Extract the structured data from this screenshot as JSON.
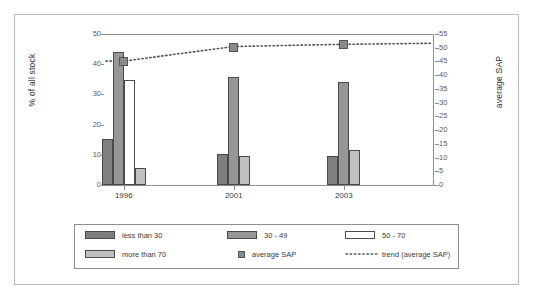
{
  "chart_data": {
    "type": "bar",
    "title": "",
    "subtitle": "",
    "categories": [
      "1996",
      "2001",
      "2003"
    ],
    "xlabel": "",
    "ylabel": "% of all stock",
    "ylabel_secondary": "average SAP",
    "ylim": [
      0,
      50
    ],
    "yticks": [
      0,
      10,
      20,
      30,
      40,
      50
    ],
    "ylim_secondary": [
      0,
      55
    ],
    "yticks_secondary": [
      0,
      5,
      10,
      15,
      20,
      25,
      30,
      35,
      40,
      45,
      50,
      55
    ],
    "grid": false,
    "legend_position": "bottom",
    "series": [
      {
        "name": "less than 30",
        "type": "bar",
        "axis": "left",
        "color": "#7f7f7f",
        "values": [
          15.2,
          10.4,
          9.5
        ]
      },
      {
        "name": "30 - 49",
        "type": "bar",
        "axis": "left",
        "color": "#969696",
        "values": [
          44.0,
          35.8,
          34.2
        ]
      },
      {
        "name": "50 - 70",
        "type": "bar",
        "axis": "left",
        "color": "#ffffff",
        "values": [
          34.8,
          0,
          0
        ]
      },
      {
        "name": "more than 70",
        "type": "bar",
        "axis": "left",
        "color": "#c0c0c0",
        "values": [
          5.5,
          9.5,
          11.5
        ]
      },
      {
        "name": "average SAP",
        "type": "scatter",
        "axis": "right",
        "color": "#8a8a8a",
        "values": [
          45.5,
          50.5,
          51.5
        ]
      },
      {
        "name": "trend (average SAP)",
        "type": "line",
        "axis": "right",
        "color": "#555555",
        "style": "dotted",
        "values": [
          45.5,
          50.8,
          51.6
        ]
      }
    ]
  },
  "legend": {
    "items": [
      {
        "label": "less than 30",
        "marker": "swatch-dark-gray"
      },
      {
        "label": "30 - 49",
        "marker": "swatch-mid-gray"
      },
      {
        "label": "50 - 70",
        "marker": "swatch-white"
      },
      {
        "label": "more than 70",
        "marker": "swatch-light-gray"
      },
      {
        "label": "average SAP",
        "marker": "square-marker"
      },
      {
        "label": "trend (average SAP)",
        "marker": "dotted-line"
      }
    ]
  },
  "colors": {
    "less_than_30": "#7f7f7f",
    "range_30_49": "#969696",
    "range_50_70": "#ffffff",
    "more_than_70": "#c0c0c0",
    "average_sap": "#8a8a8a",
    "trend": "#555555",
    "axis": "#8e8e8e",
    "frame": "#b9b9b9"
  }
}
